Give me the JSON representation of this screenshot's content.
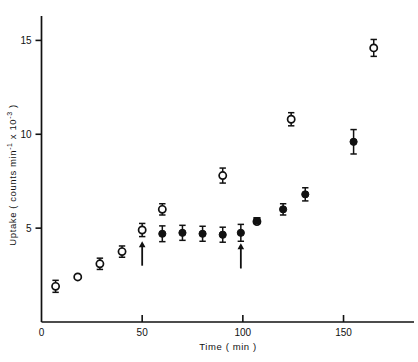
{
  "chart_data": {
    "type": "scatter",
    "title": "",
    "xlabel": "Time ( min )",
    "ylabel": "Uptake ( counts min-1 x 10-3 )",
    "ylabel_parts": {
      "prefix": "Uptake ( counts min",
      "sup1": "-1",
      "middle": " x 10",
      "sup2": "-3",
      "suffix": " )"
    },
    "xlim": [
      0,
      185
    ],
    "ylim": [
      0,
      16.3
    ],
    "xticks": [
      0,
      50,
      100,
      150
    ],
    "xtick_labels": [
      "0",
      "50",
      "100",
      "150"
    ],
    "yticks": [
      5,
      10,
      15
    ],
    "ytick_labels": [
      "5",
      "10",
      "15"
    ],
    "grid": false,
    "legend": "none",
    "series": [
      {
        "name": "open-circles",
        "marker": "open-circle",
        "points": [
          {
            "x": 7,
            "y": 1.9,
            "err": 0.32
          },
          {
            "x": 18,
            "y": 2.4,
            "err": 0.0
          },
          {
            "x": 29,
            "y": 3.1,
            "err": 0.3
          },
          {
            "x": 40,
            "y": 3.75,
            "err": 0.3
          },
          {
            "x": 50,
            "y": 4.9,
            "err": 0.35
          },
          {
            "x": 60,
            "y": 6.0,
            "err": 0.3
          },
          {
            "x": 90,
            "y": 7.8,
            "err": 0.4
          },
          {
            "x": 107,
            "y": 5.35,
            "err": 0.0
          },
          {
            "x": 124,
            "y": 10.8,
            "err": 0.35
          },
          {
            "x": 165,
            "y": 14.6,
            "err": 0.45
          }
        ]
      },
      {
        "name": "filled-circles",
        "marker": "filled-circle",
        "points": [
          {
            "x": 60,
            "y": 4.7,
            "err": 0.42
          },
          {
            "x": 70,
            "y": 4.75,
            "err": 0.4
          },
          {
            "x": 80,
            "y": 4.7,
            "err": 0.4
          },
          {
            "x": 90,
            "y": 4.65,
            "err": 0.4
          },
          {
            "x": 99,
            "y": 4.75,
            "err": 0.45
          },
          {
            "x": 120,
            "y": 6.0,
            "err": 0.3
          },
          {
            "x": 131,
            "y": 6.8,
            "err": 0.35
          },
          {
            "x": 155,
            "y": 9.6,
            "err": 0.65
          }
        ]
      },
      {
        "name": "filled-square",
        "marker": "filled-square",
        "points": [
          {
            "x": 107,
            "y": 5.4,
            "err": 0.0
          }
        ]
      }
    ],
    "annotations": [
      {
        "type": "arrow",
        "name": "arrow-first-addition",
        "x": 50,
        "y_from": 3.0,
        "y_to": 4.3
      },
      {
        "type": "arrow",
        "name": "arrow-second-addition",
        "x": 99,
        "y_from": 2.85,
        "y_to": 4.2
      }
    ],
    "colors": {
      "axis": "#111111",
      "marker": "#111111",
      "background": "#ffffff"
    }
  }
}
